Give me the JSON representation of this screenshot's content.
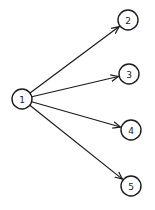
{
  "diagram": {
    "type": "directed-graph",
    "stroke_color": "#1a1a1a",
    "background": "#ffffff",
    "node_radius": 10,
    "nodes": [
      {
        "id": "1",
        "label": "1",
        "x": 22,
        "y": 99
      },
      {
        "id": "2",
        "label": "2",
        "x": 128,
        "y": 20
      },
      {
        "id": "3",
        "label": "3",
        "x": 129,
        "y": 74
      },
      {
        "id": "4",
        "label": "4",
        "x": 131,
        "y": 130
      },
      {
        "id": "5",
        "label": "5",
        "x": 131,
        "y": 186
      }
    ],
    "edges": [
      {
        "from": "1",
        "to": "2"
      },
      {
        "from": "1",
        "to": "3"
      },
      {
        "from": "1",
        "to": "4"
      },
      {
        "from": "1",
        "to": "5"
      }
    ]
  }
}
